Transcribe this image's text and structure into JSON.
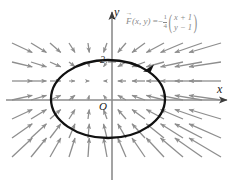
{
  "figure": {
    "background_color": "#ffffff"
  },
  "labels": {
    "y_axis": "y",
    "x_axis": "x",
    "origin": "O",
    "tick_two": "2"
  },
  "formula": {
    "function_name": "F",
    "arguments": "(x, y)",
    "equals": "=",
    "sign": "−",
    "fraction_numerator": "1",
    "fraction_denominator": "4",
    "vector_row_1": "x + 1",
    "vector_row_2": "y − 1",
    "plain_text": "F(x, y) = -1/4 (x + 1, y - 1)",
    "color": "#8a8a8a"
  },
  "chart_data": {
    "type": "scatter",
    "xlabel": "x",
    "ylabel": "y",
    "grid": false,
    "legend": null,
    "axes": {
      "origin_px": {
        "x": 112,
        "y": 100
      },
      "units_per_px": 19,
      "x_axis_y_px": 100,
      "y_axis_x_px": 112,
      "x_axis_color": "#8c8c8c",
      "y_axis_color": "#8c8c8c"
    },
    "vector_field": {
      "formula": "F(x,y) = -0.25 * (x + 1, y - 1)",
      "equilibrium_point": [
        -1,
        1
      ],
      "equilibrium_px": [
        93,
        81
      ],
      "scale_factor": 0.25,
      "direction": "inward (attracting sink)",
      "arrow_color": "#8e8e8e",
      "grid_spacing_px": 19,
      "grid_x_px": [
        12,
        31,
        50,
        69,
        88,
        107,
        126,
        145,
        164,
        183,
        202,
        221
      ],
      "grid_y_px": [
        43,
        62,
        81,
        100,
        119,
        138,
        157
      ]
    },
    "curve": {
      "shape": "ellipse",
      "center_px": [
        108,
        99
      ],
      "radius_x_px": 57,
      "radius_y_px": 39,
      "center_units": [
        -0.2,
        0.05
      ],
      "semi_axis_x_units": 3.0,
      "semi_axis_y_units": 2.05,
      "stroke_color": "#111111",
      "stroke_width_px": 2.2,
      "orientation": "clockwise",
      "orientation_marker_px": [
        150,
        66
      ]
    }
  }
}
